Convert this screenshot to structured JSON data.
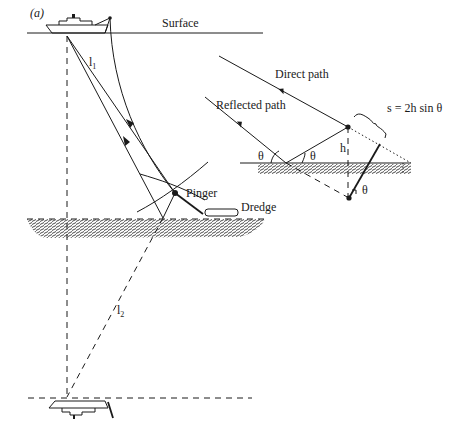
{
  "figure": {
    "panel_label": "(a)",
    "labels": {
      "surface": "Surface",
      "l1": "l",
      "l1_sub": "1",
      "l2": "l",
      "l2_sub": "2",
      "pinger": "Pinger",
      "dredge": "Dredge",
      "direct_path": "Direct path",
      "reflected_path": "Reflected path",
      "formula": "s = 2h sin θ",
      "h": "h",
      "theta1": "θ",
      "theta2": "θ",
      "theta3": "θ"
    },
    "colors": {
      "ink": "#1a1a1a",
      "background": "#ffffff"
    }
  }
}
